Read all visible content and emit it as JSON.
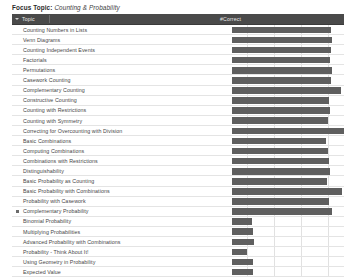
{
  "header": {
    "focus_label": "Focus Topic",
    "separator": ":",
    "focus_value": "Counting & Probability"
  },
  "table": {
    "columns": [
      "Topic",
      "#Correct"
    ],
    "sort_icon": "chevron-down-icon",
    "marker_icon": "square-bullet-icon"
  },
  "chart_data": {
    "type": "bar",
    "xlabel": "#Correct",
    "ylabel": "Topic",
    "orientation": "horizontal",
    "grid": true,
    "legend": "none",
    "xlim": [
      0,
      110
    ],
    "gridline_values": [
      25,
      50,
      75,
      100
    ],
    "categories": [
      "Counting Numbers in Lists",
      "Venn Diagrams",
      "Counting Independent Events",
      "Factorials",
      "Permutations",
      "Casework Counting",
      "Complementary Counting",
      "Constructive Counting",
      "Counting with Restrictions",
      "Counting with Symmetry",
      "Correcting for Overcounting with Division",
      "Basic Combinations",
      "Computing Combinations",
      "Combinations with Restrictions",
      "Distinguishability",
      "Basic Probability as Counting",
      "Basic Probability with Combinations",
      "Probability with Casework",
      "Complementary Probability",
      "Binomial Probability",
      "Multiplying Probabilities",
      "Advanced Probability with Combinations",
      "Probability - Think About It!",
      "Using Geometry in Probability",
      "Expected Value"
    ],
    "values": [
      91,
      92,
      91,
      90,
      92,
      91,
      100,
      89,
      90,
      88,
      103,
      86,
      88,
      89,
      90,
      87,
      101,
      89,
      92,
      18,
      19,
      20,
      14,
      19,
      19
    ],
    "marked_categories": [
      "Complementary Probability"
    ]
  },
  "rows": [
    {
      "label": "Counting Numbers in Lists",
      "value": 91,
      "marked": false
    },
    {
      "label": "Venn Diagrams",
      "value": 92,
      "marked": false
    },
    {
      "label": "Counting Independent Events",
      "value": 91,
      "marked": false
    },
    {
      "label": "Factorials",
      "value": 90,
      "marked": false
    },
    {
      "label": "Permutations",
      "value": 92,
      "marked": false
    },
    {
      "label": "Casework Counting",
      "value": 91,
      "marked": false
    },
    {
      "label": "Complementary Counting",
      "value": 100,
      "marked": false
    },
    {
      "label": "Constructive Counting",
      "value": 89,
      "marked": false
    },
    {
      "label": "Counting with Restrictions",
      "value": 90,
      "marked": false
    },
    {
      "label": "Counting with Symmetry",
      "value": 88,
      "marked": false
    },
    {
      "label": "Correcting for Overcounting with Division",
      "value": 103,
      "marked": false
    },
    {
      "label": "Basic Combinations",
      "value": 86,
      "marked": false
    },
    {
      "label": "Computing Combinations",
      "value": 88,
      "marked": false
    },
    {
      "label": "Combinations with Restrictions",
      "value": 89,
      "marked": false
    },
    {
      "label": "Distinguishability",
      "value": 90,
      "marked": false
    },
    {
      "label": "Basic Probability as Counting",
      "value": 87,
      "marked": false
    },
    {
      "label": "Basic Probability with Combinations",
      "value": 101,
      "marked": false
    },
    {
      "label": "Probability with Casework",
      "value": 89,
      "marked": false
    },
    {
      "label": "Complementary Probability",
      "value": 92,
      "marked": true
    },
    {
      "label": "Binomial Probability",
      "value": 18,
      "marked": false
    },
    {
      "label": "Multiplying Probabilities",
      "value": 19,
      "marked": false
    },
    {
      "label": "Advanced Probability with Combinations",
      "value": 20,
      "marked": false
    },
    {
      "label": "Probability - Think About It!",
      "value": 14,
      "marked": false
    },
    {
      "label": "Using Geometry in Probability",
      "value": 19,
      "marked": false
    },
    {
      "label": "Expected Value",
      "value": 19,
      "marked": false
    }
  ]
}
